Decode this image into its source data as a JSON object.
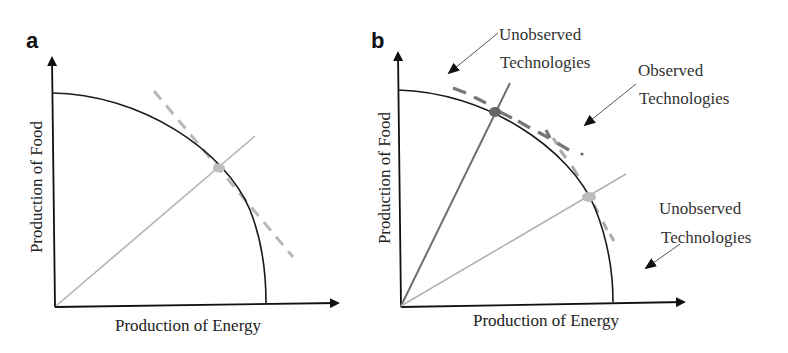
{
  "panels": [
    {
      "label": "a",
      "x_axis_label": "Production of Energy",
      "y_axis_label": "Production of Food",
      "elements": {
        "frontier": "production possibility frontier (solid black curve)",
        "ray": "single technology ray (light gray)",
        "point": "observed point (light gray)",
        "tangent": "tangent line (light gray dashed)"
      }
    },
    {
      "label": "b",
      "x_axis_label": "Production of Energy",
      "y_axis_label": "Production of Food",
      "annotations": [
        {
          "line1": "Unobserved",
          "line2": "Technologies",
          "position": "top-left"
        },
        {
          "line1": "Observed",
          "line2": "Technologies",
          "position": "top-right"
        },
        {
          "line1": "Unobserved",
          "line2": "Technologies",
          "position": "right"
        }
      ],
      "elements": {
        "frontier": "production possibility frontier (solid black curve)",
        "ray_dark": "food-intensive technology ray (dark gray)",
        "ray_light": "energy-intensive technology ray (light gray)",
        "point_dark": "observed point (dark gray)",
        "point_light": "observed point (light gray)",
        "tangent_segments": "observed technology tangent segments (dashed)"
      }
    }
  ],
  "colors": {
    "axis": "#111111",
    "frontier": "#1a1a1a",
    "light_gray": "#b3b3b3",
    "dark_gray": "#6e6e6e",
    "annotation_arrow": "#555555"
  }
}
